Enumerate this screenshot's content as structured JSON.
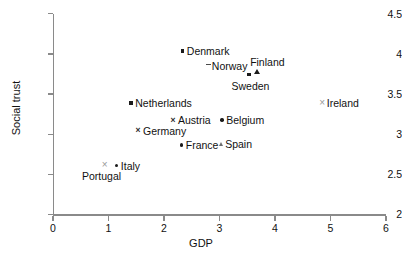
{
  "chart_data": {
    "type": "scatter",
    "title": "",
    "xlabel": "GDP",
    "ylabel": "Social trust",
    "xlim": [
      0,
      6
    ],
    "ylim": [
      2,
      4.5
    ],
    "xticks": [
      "0",
      "1",
      "2",
      "3",
      "4",
      "5",
      "6"
    ],
    "yticks": [
      "2",
      "2.5",
      "3",
      "3.5",
      "4",
      "4.5"
    ],
    "grid": false,
    "legend": "none",
    "labels_inline": true,
    "points": [
      {
        "name": "Denmark",
        "x": 2.34,
        "y": 4.03,
        "marker": "square",
        "label_pos": "right"
      },
      {
        "name": "Norway",
        "x": 2.79,
        "y": 3.85,
        "marker": "dash",
        "label_pos": "right"
      },
      {
        "name": "Finland",
        "x": 3.66,
        "y": 3.78,
        "marker": "triangle",
        "label_pos": "above"
      },
      {
        "name": "Sweden",
        "x": 3.53,
        "y": 3.74,
        "marker": "square",
        "label_pos": "below"
      },
      {
        "name": "Ireland",
        "x": 4.86,
        "y": 3.39,
        "marker": "cross-grey",
        "label_pos": "right"
      },
      {
        "name": "Netherlands",
        "x": 1.41,
        "y": 3.38,
        "marker": "square",
        "label_pos": "right"
      },
      {
        "name": "Austria",
        "x": 2.18,
        "y": 3.17,
        "marker": "cross",
        "label_pos": "right"
      },
      {
        "name": "Belgium",
        "x": 3.05,
        "y": 3.17,
        "marker": "dot",
        "label_pos": "right"
      },
      {
        "name": "Germany",
        "x": 1.55,
        "y": 3.04,
        "marker": "cross",
        "label_pos": "right"
      },
      {
        "name": "Spain",
        "x": 3.03,
        "y": 2.88,
        "marker": "triangle-sm",
        "label_pos": "right"
      },
      {
        "name": "France",
        "x": 2.32,
        "y": 2.86,
        "marker": "dot",
        "label_pos": "right"
      },
      {
        "name": "Portugal",
        "x": 0.94,
        "y": 2.61,
        "marker": "cross-grey",
        "label_pos": "below"
      },
      {
        "name": "Italy",
        "x": 1.15,
        "y": 2.6,
        "marker": "dot",
        "label_pos": "right"
      }
    ]
  },
  "axes": {
    "x_title": "GDP",
    "y_title": "Social trust",
    "x_tick_labels": [
      "0",
      "1",
      "2",
      "3",
      "4",
      "5",
      "6"
    ],
    "y_tick_labels": [
      "2",
      "2.5",
      "3",
      "3.5",
      "4",
      "4.5"
    ]
  },
  "colors": {
    "axis": "#8a8a8a",
    "marker_dark": "#1b1b1b",
    "marker_grey": "#9a9a9a",
    "text": "#111111",
    "background": "#ffffff"
  }
}
